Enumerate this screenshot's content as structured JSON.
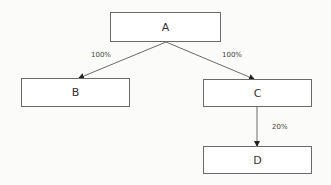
{
  "diagram": {
    "type": "flow-tree",
    "nodes": [
      {
        "id": "A",
        "label": "A"
      },
      {
        "id": "B",
        "label": "B"
      },
      {
        "id": "C",
        "label": "C"
      },
      {
        "id": "D",
        "label": "D"
      }
    ],
    "edges": [
      {
        "from": "A",
        "to": "B",
        "label": "100%"
      },
      {
        "from": "A",
        "to": "C",
        "label": "100%"
      },
      {
        "from": "C",
        "to": "D",
        "label": "20%"
      }
    ],
    "colors": {
      "line": "#5a5a5a",
      "text": "#333333",
      "background": "#fbfbfa"
    }
  }
}
